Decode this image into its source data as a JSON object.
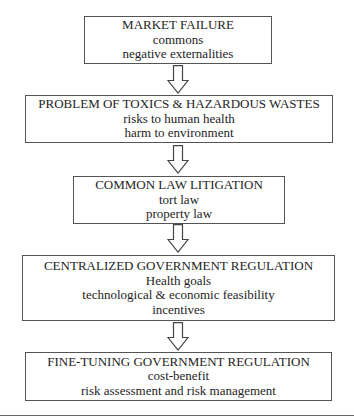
{
  "diagram": {
    "type": "vertical-flowchart",
    "boxes": [
      {
        "id": "market-failure",
        "title": "MARKET FAILURE",
        "items": [
          "commons",
          "negative externalities"
        ]
      },
      {
        "id": "toxics-problem",
        "title": "PROBLEM OF TOXICS & HAZARDOUS WASTES",
        "items": [
          "risks to human health",
          "harm to environment"
        ]
      },
      {
        "id": "common-law",
        "title": "COMMON LAW LITIGATION",
        "items": [
          "tort law",
          "property law"
        ]
      },
      {
        "id": "centralized-regulation",
        "title": "CENTRALIZED GOVERNMENT REGULATION",
        "items": [
          "Health goals",
          "technological & economic feasibility",
          "incentives"
        ]
      },
      {
        "id": "fine-tuning-regulation",
        "title": "FINE-TUNING GOVERNMENT REGULATION",
        "items": [
          "cost-benefit",
          "risk assessment and risk management"
        ]
      }
    ],
    "arrows": [
      {
        "from": "market-failure",
        "to": "toxics-problem",
        "icon": "down-arrow-icon"
      },
      {
        "from": "toxics-problem",
        "to": "common-law",
        "icon": "down-arrow-icon"
      },
      {
        "from": "common-law",
        "to": "centralized-regulation",
        "icon": "down-arrow-icon"
      },
      {
        "from": "centralized-regulation",
        "to": "fine-tuning-regulation",
        "icon": "down-arrow-icon"
      }
    ],
    "colors": {
      "text": "#1e1e1e",
      "border": "#555555",
      "background": "#ffffff"
    }
  }
}
